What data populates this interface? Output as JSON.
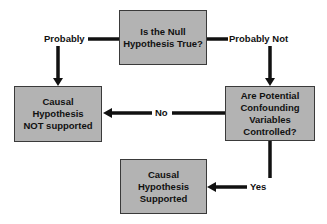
{
  "diagram": {
    "type": "flowchart",
    "colors": {
      "box_fill": "#b3b3b3",
      "box_border": "#3a3a3a",
      "line": "#111111",
      "background": "#ffffff"
    },
    "nodes": [
      {
        "id": "null-question",
        "text": "Is the Null\nHypothesis True?"
      },
      {
        "id": "not-supported",
        "text": "Causal\nHypothesis\nNOT supported"
      },
      {
        "id": "confound-question",
        "text": "Are Potential\nConfounding\nVariables\nControlled?"
      },
      {
        "id": "supported",
        "text": "Causal\nHypothesis\nSupported"
      }
    ],
    "edges": [
      {
        "from": "null-question",
        "to": "not-supported",
        "label": "Probably"
      },
      {
        "from": "null-question",
        "to": "confound-question",
        "label": "Probably Not"
      },
      {
        "from": "confound-question",
        "to": "not-supported",
        "label": "No"
      },
      {
        "from": "confound-question",
        "to": "supported",
        "label": "Yes"
      }
    ]
  }
}
